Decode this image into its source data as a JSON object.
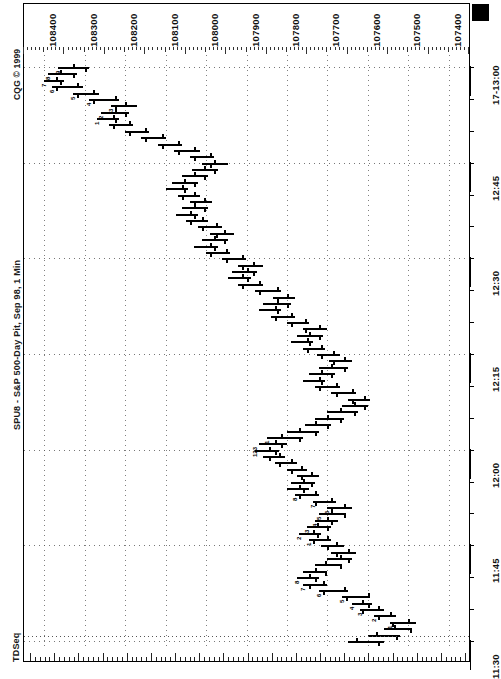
{
  "app": {
    "vendor_copyright": "CQG © 1999",
    "chart_title": "SPU8 - S&P 500-Day Pit, Sep 98, 1 Min",
    "study_label": "TDSeq",
    "marker_icon": "filled-square-marker"
  },
  "price_axis": {
    "title": "Price",
    "labels": [
      "108400",
      "108300",
      "108200",
      "108100",
      "108000",
      "107900",
      "107800",
      "107700",
      "107600",
      "107500",
      "107400"
    ],
    "values": [
      108400,
      108300,
      108200,
      108100,
      108000,
      107900,
      107800,
      107700,
      107600,
      107500,
      107400
    ],
    "min": 107350,
    "max": 108450
  },
  "time_axis": {
    "labels": [
      "17-13:00",
      "12:45",
      "12:30",
      "12:15",
      "12:00",
      "11:45",
      "11:30"
    ],
    "interval": "1 Min"
  },
  "chart_data": {
    "type": "bar",
    "subtype": "ohlc-bar-rotated",
    "title": "SPU8 - S&P 500-Day Pit, Sep 98, 1 Min",
    "xlabel": "Time",
    "ylabel": "Price",
    "ylim": [
      107350,
      108450
    ],
    "grid": true,
    "legend": "none",
    "orientation": "rotated-90",
    "annotations": [
      "TDSeq setup/countdown digits 1-9 and 13 printed beside bars"
    ],
    "x": [
      "11:30",
      "11:31",
      "11:32",
      "11:33",
      "11:34",
      "11:35",
      "11:36",
      "11:37",
      "11:38",
      "11:39",
      "11:40",
      "11:41",
      "11:42",
      "11:43",
      "11:44",
      "11:45",
      "11:46",
      "11:47",
      "11:48",
      "11:49",
      "11:50",
      "11:51",
      "11:52",
      "11:53",
      "11:54",
      "11:55",
      "11:56",
      "11:57",
      "11:58",
      "11:59",
      "12:00",
      "12:01",
      "12:02",
      "12:03",
      "12:04",
      "12:05",
      "12:06",
      "12:07",
      "12:08",
      "12:09",
      "12:10",
      "12:11",
      "12:12",
      "12:13",
      "12:14",
      "12:15",
      "12:16",
      "12:17",
      "12:18",
      "12:19",
      "12:20",
      "12:21",
      "12:22",
      "12:23",
      "12:24",
      "12:25",
      "12:26",
      "12:27",
      "12:28",
      "12:29",
      "12:30",
      "12:31",
      "12:32",
      "12:33",
      "12:34",
      "12:35",
      "12:36",
      "12:37",
      "12:38",
      "12:39",
      "12:40",
      "12:41",
      "12:42",
      "12:43",
      "12:44",
      "12:45",
      "12:46",
      "12:47",
      "12:48",
      "12:49",
      "12:50",
      "12:51",
      "12:52",
      "12:53",
      "12:54",
      "12:55",
      "12:56",
      "12:57",
      "12:58",
      "12:59",
      "13:00"
    ],
    "bars": [
      {
        "t": "11:30",
        "o": 107630,
        "h": 107650,
        "l": 107560,
        "c": 107575,
        "td": ""
      },
      {
        "t": "11:31",
        "o": 107580,
        "h": 107600,
        "l": 107520,
        "c": 107530,
        "td": ""
      },
      {
        "t": "11:32",
        "o": 107535,
        "h": 107560,
        "l": 107490,
        "c": 107495,
        "td": ""
      },
      {
        "t": "11:33",
        "o": 107500,
        "h": 107545,
        "l": 107480,
        "c": 107540,
        "td": "1"
      },
      {
        "t": "11:34",
        "o": 107545,
        "h": 107585,
        "l": 107530,
        "c": 107575,
        "td": "2"
      },
      {
        "t": "11:35",
        "o": 107575,
        "h": 107620,
        "l": 107560,
        "c": 107615,
        "td": "3"
      },
      {
        "t": "11:36",
        "o": 107615,
        "h": 107640,
        "l": 107590,
        "c": 107600,
        "td": "4"
      },
      {
        "t": "11:37",
        "o": 107600,
        "h": 107665,
        "l": 107595,
        "c": 107655,
        "td": "5"
      },
      {
        "t": "11:38",
        "o": 107660,
        "h": 107720,
        "l": 107650,
        "c": 107710,
        "td": "6"
      },
      {
        "t": "11:39",
        "o": 107710,
        "h": 107760,
        "l": 107700,
        "c": 107745,
        "td": "7"
      },
      {
        "t": "11:40",
        "o": 107745,
        "h": 107775,
        "l": 107720,
        "c": 107730,
        "td": "8"
      },
      {
        "t": "11:41",
        "o": 107730,
        "h": 107760,
        "l": 107700,
        "c": 107705,
        "td": ""
      },
      {
        "t": "11:42",
        "o": 107705,
        "h": 107730,
        "l": 107665,
        "c": 107670,
        "td": ""
      },
      {
        "t": "11:43",
        "o": 107670,
        "h": 107700,
        "l": 107640,
        "c": 107650,
        "td": ""
      },
      {
        "t": "11:44",
        "o": 107650,
        "h": 107690,
        "l": 107630,
        "c": 107680,
        "td": ""
      },
      {
        "t": "11:45",
        "o": 107680,
        "h": 107715,
        "l": 107660,
        "c": 107700,
        "td": ""
      },
      {
        "t": "11:46",
        "o": 107700,
        "h": 107745,
        "l": 107690,
        "c": 107735,
        "td": "1"
      },
      {
        "t": "11:47",
        "o": 107735,
        "h": 107770,
        "l": 107715,
        "c": 107725,
        "td": "2"
      },
      {
        "t": "11:48",
        "o": 107725,
        "h": 107750,
        "l": 107690,
        "c": 107700,
        "td": "3"
      },
      {
        "t": "11:49",
        "o": 107700,
        "h": 107730,
        "l": 107675,
        "c": 107690,
        "td": "4"
      },
      {
        "t": "11:50",
        "o": 107690,
        "h": 107720,
        "l": 107655,
        "c": 107660,
        "td": "5"
      },
      {
        "t": "11:51",
        "o": 107660,
        "h": 107700,
        "l": 107640,
        "c": 107690,
        "td": "6"
      },
      {
        "t": "11:52",
        "o": 107690,
        "h": 107735,
        "l": 107680,
        "c": 107730,
        "td": "7"
      },
      {
        "t": "11:53",
        "o": 107730,
        "h": 107780,
        "l": 107720,
        "c": 107770,
        "td": "8"
      },
      {
        "t": "11:54",
        "o": 107770,
        "h": 107800,
        "l": 107745,
        "c": 107760,
        "td": ""
      },
      {
        "t": "11:55",
        "o": 107760,
        "h": 107790,
        "l": 107730,
        "c": 107740,
        "td": ""
      },
      {
        "t": "11:56",
        "o": 107740,
        "h": 107775,
        "l": 107720,
        "c": 107765,
        "td": ""
      },
      {
        "t": "11:57",
        "o": 107765,
        "h": 107800,
        "l": 107750,
        "c": 107790,
        "td": ""
      },
      {
        "t": "11:58",
        "o": 107790,
        "h": 107830,
        "l": 107775,
        "c": 107820,
        "td": ""
      },
      {
        "t": "11:59",
        "o": 107820,
        "h": 107860,
        "l": 107805,
        "c": 107845,
        "td": ""
      },
      {
        "t": "12:00",
        "o": 107845,
        "h": 107880,
        "l": 107820,
        "c": 107830,
        "td": "123"
      },
      {
        "t": "12:01",
        "o": 107830,
        "h": 107870,
        "l": 107800,
        "c": 107815,
        "td": ""
      },
      {
        "t": "12:02",
        "o": 107815,
        "h": 107850,
        "l": 107760,
        "c": 107770,
        "td": "1"
      },
      {
        "t": "12:03",
        "o": 107770,
        "h": 107800,
        "l": 107720,
        "c": 107730,
        "td": ""
      },
      {
        "t": "12:04",
        "o": 107730,
        "h": 107755,
        "l": 107690,
        "c": 107700,
        "td": ""
      },
      {
        "t": "12:05",
        "o": 107700,
        "h": 107730,
        "l": 107660,
        "c": 107670,
        "td": ""
      },
      {
        "t": "12:06",
        "o": 107670,
        "h": 107700,
        "l": 107625,
        "c": 107635,
        "td": ""
      },
      {
        "t": "12:07",
        "o": 107635,
        "h": 107665,
        "l": 107600,
        "c": 107610,
        "td": ""
      },
      {
        "t": "12:08",
        "o": 107610,
        "h": 107650,
        "l": 107595,
        "c": 107640,
        "td": ""
      },
      {
        "t": "12:09",
        "o": 107640,
        "h": 107690,
        "l": 107630,
        "c": 107680,
        "td": ""
      },
      {
        "t": "12:10",
        "o": 107680,
        "h": 107730,
        "l": 107670,
        "c": 107720,
        "td": ""
      },
      {
        "t": "12:11",
        "o": 107720,
        "h": 107760,
        "l": 107705,
        "c": 107715,
        "td": ""
      },
      {
        "t": "12:12",
        "o": 107715,
        "h": 107745,
        "l": 107680,
        "c": 107690,
        "td": ""
      },
      {
        "t": "12:13",
        "o": 107690,
        "h": 107720,
        "l": 107650,
        "c": 107660,
        "td": ""
      },
      {
        "t": "12:14",
        "o": 107660,
        "h": 107695,
        "l": 107640,
        "c": 107685,
        "td": ""
      },
      {
        "t": "12:15",
        "o": 107685,
        "h": 107725,
        "l": 107670,
        "c": 107715,
        "td": ""
      },
      {
        "t": "12:16",
        "o": 107715,
        "h": 107760,
        "l": 107705,
        "c": 107750,
        "td": ""
      },
      {
        "t": "12:17",
        "o": 107750,
        "h": 107790,
        "l": 107735,
        "c": 107745,
        "td": ""
      },
      {
        "t": "12:18",
        "o": 107745,
        "h": 107775,
        "l": 107710,
        "c": 107720,
        "td": ""
      },
      {
        "t": "12:19",
        "o": 107720,
        "h": 107760,
        "l": 107700,
        "c": 107755,
        "td": ""
      },
      {
        "t": "12:20",
        "o": 107755,
        "h": 107800,
        "l": 107745,
        "c": 107790,
        "td": ""
      },
      {
        "t": "12:21",
        "o": 107790,
        "h": 107840,
        "l": 107780,
        "c": 107830,
        "td": ""
      },
      {
        "t": "12:22",
        "o": 107830,
        "h": 107870,
        "l": 107815,
        "c": 107825,
        "td": ""
      },
      {
        "t": "12:23",
        "o": 107825,
        "h": 107860,
        "l": 107790,
        "c": 107800,
        "td": ""
      },
      {
        "t": "12:24",
        "o": 107800,
        "h": 107835,
        "l": 107780,
        "c": 107825,
        "td": ""
      },
      {
        "t": "12:25",
        "o": 107825,
        "h": 107880,
        "l": 107815,
        "c": 107870,
        "td": ""
      },
      {
        "t": "12:26",
        "o": 107870,
        "h": 107920,
        "l": 107860,
        "c": 107910,
        "td": ""
      },
      {
        "t": "12:27",
        "o": 107910,
        "h": 107945,
        "l": 107890,
        "c": 107900,
        "td": ""
      },
      {
        "t": "12:28",
        "o": 107900,
        "h": 107935,
        "l": 107875,
        "c": 107885,
        "td": ""
      },
      {
        "t": "12:29",
        "o": 107885,
        "h": 107920,
        "l": 107860,
        "c": 107910,
        "td": ""
      },
      {
        "t": "12:30",
        "o": 107910,
        "h": 107960,
        "l": 107900,
        "c": 107950,
        "td": ""
      },
      {
        "t": "12:31",
        "o": 107950,
        "h": 108000,
        "l": 107940,
        "c": 107990,
        "td": ""
      },
      {
        "t": "12:32",
        "o": 107990,
        "h": 108030,
        "l": 107970,
        "c": 107980,
        "td": ""
      },
      {
        "t": "12:33",
        "o": 107980,
        "h": 108010,
        "l": 107945,
        "c": 107955,
        "td": ""
      },
      {
        "t": "12:34",
        "o": 107955,
        "h": 107990,
        "l": 107930,
        "c": 107975,
        "td": ""
      },
      {
        "t": "12:35",
        "o": 107975,
        "h": 108020,
        "l": 107960,
        "c": 108010,
        "td": ""
      },
      {
        "t": "12:36",
        "o": 108010,
        "h": 108050,
        "l": 107995,
        "c": 108040,
        "td": ""
      },
      {
        "t": "12:37",
        "o": 108040,
        "h": 108075,
        "l": 108020,
        "c": 108030,
        "td": ""
      },
      {
        "t": "12:38",
        "o": 108030,
        "h": 108060,
        "l": 107995,
        "c": 108005,
        "td": ""
      },
      {
        "t": "12:39",
        "o": 108005,
        "h": 108040,
        "l": 107985,
        "c": 108030,
        "td": ""
      },
      {
        "t": "12:40",
        "o": 108030,
        "h": 108070,
        "l": 108015,
        "c": 108060,
        "td": ""
      },
      {
        "t": "12:41",
        "o": 108060,
        "h": 108100,
        "l": 108045,
        "c": 108055,
        "td": ""
      },
      {
        "t": "12:42",
        "o": 108055,
        "h": 108085,
        "l": 108020,
        "c": 108030,
        "td": ""
      },
      {
        "t": "12:43",
        "o": 108030,
        "h": 108060,
        "l": 107995,
        "c": 108005,
        "td": ""
      },
      {
        "t": "12:44",
        "o": 108005,
        "h": 108035,
        "l": 107970,
        "c": 107980,
        "td": ""
      },
      {
        "t": "12:45",
        "o": 107980,
        "h": 108010,
        "l": 107945,
        "c": 107990,
        "td": ""
      },
      {
        "t": "12:46",
        "o": 107990,
        "h": 108040,
        "l": 107980,
        "c": 108030,
        "td": ""
      },
      {
        "t": "12:47",
        "o": 108030,
        "h": 108080,
        "l": 108015,
        "c": 108070,
        "td": ""
      },
      {
        "t": "12:48",
        "o": 108070,
        "h": 108120,
        "l": 108060,
        "c": 108110,
        "td": ""
      },
      {
        "t": "12:49",
        "o": 108110,
        "h": 108160,
        "l": 108100,
        "c": 108150,
        "td": ""
      },
      {
        "t": "12:50",
        "o": 108150,
        "h": 108200,
        "l": 108140,
        "c": 108190,
        "td": ""
      },
      {
        "t": "12:51",
        "o": 108190,
        "h": 108240,
        "l": 108180,
        "c": 108230,
        "td": ""
      },
      {
        "t": "12:52",
        "o": 108230,
        "h": 108270,
        "l": 108215,
        "c": 108225,
        "td": "1"
      },
      {
        "t": "12:53",
        "o": 108225,
        "h": 108260,
        "l": 108190,
        "c": 108200,
        "td": "2"
      },
      {
        "t": "12:54",
        "o": 108200,
        "h": 108235,
        "l": 108170,
        "c": 108225,
        "td": "3"
      },
      {
        "t": "12:55",
        "o": 108225,
        "h": 108290,
        "l": 108215,
        "c": 108280,
        "td": "4"
      },
      {
        "t": "12:56",
        "o": 108280,
        "h": 108330,
        "l": 108265,
        "c": 108320,
        "td": "5"
      },
      {
        "t": "12:57",
        "o": 108320,
        "h": 108380,
        "l": 108305,
        "c": 108370,
        "td": "6"
      },
      {
        "t": "12:58",
        "o": 108370,
        "h": 108400,
        "l": 108350,
        "c": 108360,
        "td": "7"
      },
      {
        "t": "12:59",
        "o": 108360,
        "h": 108390,
        "l": 108320,
        "c": 108330,
        "td": "8"
      },
      {
        "t": "13:00",
        "o": 108330,
        "h": 108365,
        "l": 108290,
        "c": 108300,
        "td": "9"
      }
    ]
  },
  "colors": {
    "background": "#ffffff",
    "bar": "#000000",
    "grid": "#555555",
    "axis": "#000000",
    "text": "#111111"
  }
}
